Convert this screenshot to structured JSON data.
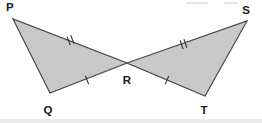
{
  "figure": {
    "fill_color": "#c9c9c9",
    "stroke_color": "#4a4a4a",
    "label_color": "#1a1a1a",
    "background_color": "#ffffff",
    "width": 262,
    "height": 123
  },
  "points": {
    "P": {
      "label": "P",
      "x": 13,
      "y": 19,
      "label_x": 6,
      "label_y": 11
    },
    "Q": {
      "label": "Q",
      "x": 50,
      "y": 93,
      "label_x": 48,
      "label_y": 114
    },
    "R": {
      "label": "R",
      "x": 127,
      "y": 63,
      "label_x": 127,
      "label_y": 84
    },
    "S": {
      "label": "S",
      "x": 247,
      "y": 21,
      "label_x": 246,
      "label_y": 14
    },
    "T": {
      "label": "T",
      "x": 205,
      "y": 96,
      "label_x": 204,
      "label_y": 114
    }
  },
  "triangles": [
    {
      "name": "triangle-PQR",
      "vertices": "P,Q,R",
      "points_path": "13,19 50,93 127,63",
      "fill": "#c9c9c9"
    },
    {
      "name": "triangle-RST",
      "vertices": "R,S,T",
      "points_path": "127,63 247,21 205,96",
      "fill": "#c9c9c9"
    }
  ],
  "segments": [
    {
      "name": "segment-PR",
      "from": "P",
      "to": "R",
      "ticks": 2
    },
    {
      "name": "segment-QR",
      "from": "Q",
      "to": "R",
      "ticks": 1
    },
    {
      "name": "segment-RS",
      "from": "R",
      "to": "S",
      "ticks": 2
    },
    {
      "name": "segment-RT",
      "from": "R",
      "to": "T",
      "ticks": 1
    },
    {
      "name": "segment-PQ",
      "from": "P",
      "to": "Q",
      "ticks": 0
    },
    {
      "name": "segment-ST",
      "from": "S",
      "to": "T",
      "ticks": 0
    }
  ],
  "tick_marks": {
    "pr": {
      "label": "double-tick",
      "count": 2,
      "cx": 71,
      "cy": 40,
      "angle": -21
    },
    "qr": {
      "label": "single-tick",
      "count": 1,
      "cx": 87,
      "cy": 80,
      "angle": -21
    },
    "rs": {
      "label": "double-tick",
      "count": 2,
      "cx": 184,
      "cy": 44,
      "angle": -19
    },
    "rt": {
      "label": "single-tick",
      "count": 1,
      "cx": 167,
      "cy": 80,
      "angle": 23
    }
  },
  "artifacts": {
    "top_bar_1": {
      "x": 186,
      "y": 2,
      "w": 22,
      "h": 2
    },
    "top_bar_2": {
      "x": 224,
      "y": 2,
      "w": 14,
      "h": 2
    },
    "bottom_band": {
      "x": 0,
      "y": 119,
      "w": 262,
      "h": 4
    }
  }
}
